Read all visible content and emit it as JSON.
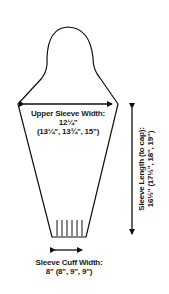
{
  "diagram": {
    "type": "knitting-schematic",
    "subject": "sleeve",
    "colors": {
      "line": "#111111",
      "text": "#1a1a1a",
      "background": "#ffffff"
    },
    "labels": {
      "upper_sleeve_width": {
        "title": "Upper Sleeve Width:",
        "value": "12¼\"",
        "sizes": "(13¼\", 13¾\", 15\")"
      },
      "sleeve_length": {
        "title": "Sleeve Length (to cap):",
        "value": "16½\" (17½\", 18\", 19\")"
      },
      "sleeve_cuff_width": {
        "title": "Sleeve Cuff Width:",
        "value": "8\" (8\", 9\", 9\")"
      }
    },
    "ribbing_lines": 6
  }
}
